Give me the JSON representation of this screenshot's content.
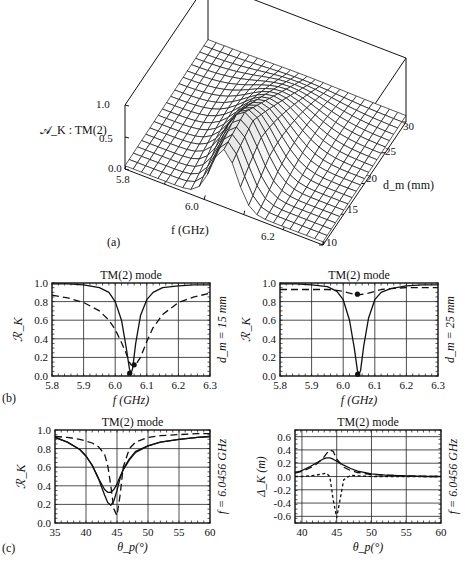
{
  "figure": {
    "header_fragment": "…",
    "panel_a": {
      "label": "(a)",
      "z_label": "𝒜_K : TM(2)",
      "z_ticks": [
        "0.0",
        "0.5",
        "1.0"
      ],
      "x_label": "f (GHz)",
      "x_ticks": [
        "5.8",
        "6.0",
        "6.2"
      ],
      "y_label": "d_m (mm)",
      "y_ticks": [
        "10",
        "15",
        "20",
        "25",
        "30"
      ]
    },
    "panel_b": {
      "label": "(b)",
      "left": {
        "title": "TM(2) mode",
        "ylabel": "ℛ_K",
        "xlabel": "f (GHz)",
        "side_label": "d_m = 15 mm"
      },
      "right": {
        "title": "TM(2) mode",
        "ylabel": "ℛ_K",
        "xlabel": "f (GHz)",
        "side_label": "d_m = 25 mm"
      }
    },
    "panel_c": {
      "label": "(c)",
      "left": {
        "title": "TM(2) mode",
        "ylabel": "ℛ_K",
        "xlabel": "θ_p(°)",
        "side_label": "f = 6.0456 GHz"
      },
      "right": {
        "title": "TM(2) mode",
        "ylabel": "Δ_K (m)",
        "xlabel": "θ_p(°)",
        "side_label": "f = 6.0456 GHz"
      }
    }
  },
  "chart_data": [
    {
      "id": "a",
      "type": "surface3d",
      "title": "",
      "xlabel": "f (GHz)",
      "ylabel": "d_m (mm)",
      "zlabel": "A_K : TM(2)",
      "xlim": [
        5.8,
        6.3
      ],
      "ylim": [
        10,
        30
      ],
      "zlim": [
        0,
        1
      ],
      "x_ticks": [
        5.8,
        6.0,
        6.2
      ],
      "y_ticks": [
        10,
        15,
        20,
        25,
        30
      ],
      "z_ticks": [
        0.0,
        0.5,
        1.0
      ],
      "description": "Absorption surface peaking near f≈6.05 GHz, d_m≈15 mm (~1.0), decaying to ~0.05 at the edges and for large d_m (~0.1 at 30 mm)",
      "peak": {
        "f": 6.05,
        "d_m": 15,
        "value": 1.0
      }
    },
    {
      "id": "b-left",
      "type": "line",
      "title": "TM(2) mode",
      "xlabel": "f (GHz)",
      "ylabel": "R_K",
      "xlim": [
        5.8,
        6.3
      ],
      "ylim": [
        0,
        1
      ],
      "x_ticks": [
        5.8,
        5.9,
        6.0,
        6.1,
        6.2,
        6.3
      ],
      "y_ticks": [
        0.0,
        0.2,
        0.4,
        0.6,
        0.8,
        1.0
      ],
      "grid": true,
      "annotation": "d_m = 15 mm",
      "x": [
        5.8,
        5.85,
        5.9,
        5.95,
        5.98,
        6.0,
        6.02,
        6.035,
        6.045,
        6.05,
        6.055,
        6.065,
        6.08,
        6.1,
        6.12,
        6.15,
        6.2,
        6.25,
        6.3
      ],
      "series": [
        {
          "name": "solid",
          "style": "solid",
          "values": [
            0.99,
            0.99,
            0.98,
            0.95,
            0.9,
            0.8,
            0.6,
            0.3,
            0.08,
            0.03,
            0.08,
            0.35,
            0.65,
            0.82,
            0.9,
            0.95,
            0.97,
            0.98,
            0.98
          ]
        },
        {
          "name": "dashed",
          "style": "dashed",
          "values": [
            0.87,
            0.84,
            0.79,
            0.7,
            0.6,
            0.5,
            0.36,
            0.24,
            0.15,
            0.12,
            0.11,
            0.12,
            0.2,
            0.37,
            0.52,
            0.66,
            0.79,
            0.85,
            0.89
          ]
        }
      ],
      "markers": [
        {
          "series": "solid",
          "x": 6.046,
          "y": 0.03
        },
        {
          "series": "dashed",
          "x": 6.06,
          "y": 0.12
        }
      ]
    },
    {
      "id": "b-right",
      "type": "line",
      "title": "TM(2) mode",
      "xlabel": "f (GHz)",
      "ylabel": "R_K",
      "xlim": [
        5.8,
        6.3
      ],
      "ylim": [
        0,
        1
      ],
      "x_ticks": [
        5.8,
        5.9,
        6.0,
        6.1,
        6.2,
        6.3
      ],
      "y_ticks": [
        0.0,
        0.2,
        0.4,
        0.6,
        0.8,
        1.0
      ],
      "grid": true,
      "annotation": "d_m = 25 mm",
      "x": [
        5.8,
        5.85,
        5.9,
        5.95,
        5.98,
        6.0,
        6.02,
        6.035,
        6.045,
        6.05,
        6.055,
        6.065,
        6.08,
        6.1,
        6.12,
        6.15,
        6.2,
        6.25,
        6.3
      ],
      "series": [
        {
          "name": "solid",
          "style": "solid",
          "values": [
            0.99,
            0.99,
            0.98,
            0.96,
            0.91,
            0.82,
            0.6,
            0.3,
            0.06,
            0.02,
            0.06,
            0.32,
            0.62,
            0.82,
            0.9,
            0.94,
            0.97,
            0.98,
            0.98
          ]
        },
        {
          "name": "dashed",
          "style": "dashed",
          "values": [
            0.93,
            0.93,
            0.93,
            0.93,
            0.92,
            0.91,
            0.89,
            0.88,
            0.875,
            0.875,
            0.876,
            0.88,
            0.89,
            0.91,
            0.93,
            0.94,
            0.95,
            0.95,
            0.95
          ]
        }
      ],
      "markers": [
        {
          "series": "solid",
          "x": 6.046,
          "y": 0.02
        },
        {
          "series": "dashed",
          "x": 6.045,
          "y": 0.88
        }
      ]
    },
    {
      "id": "c-left",
      "type": "line",
      "title": "TM(2) mode",
      "xlabel": "θ_p (°)",
      "ylabel": "R_K",
      "xlim": [
        35,
        60
      ],
      "ylim": [
        0,
        1
      ],
      "x_ticks": [
        35,
        40,
        45,
        50,
        55,
        60
      ],
      "y_ticks": [
        0.0,
        0.2,
        0.4,
        0.6,
        0.8,
        1.0
      ],
      "grid": true,
      "annotation": "f = 6.0456 GHz",
      "x": [
        35,
        37,
        39,
        40,
        41,
        42,
        43,
        43.5,
        44,
        44.5,
        45,
        45.5,
        46,
        47,
        48,
        50,
        52,
        55,
        58,
        60
      ],
      "series": [
        {
          "name": "solid",
          "style": "solid",
          "values": [
            0.92,
            0.87,
            0.79,
            0.72,
            0.62,
            0.48,
            0.36,
            0.33,
            0.33,
            0.36,
            0.42,
            0.5,
            0.57,
            0.68,
            0.76,
            0.83,
            0.87,
            0.9,
            0.92,
            0.93
          ]
        },
        {
          "name": "solid-2",
          "style": "solid",
          "values": [
            0.92,
            0.87,
            0.79,
            0.72,
            0.62,
            0.48,
            0.3,
            0.22,
            0.19,
            0.24,
            0.35,
            0.48,
            0.58,
            0.69,
            0.77,
            0.83,
            0.87,
            0.9,
            0.92,
            0.93
          ]
        },
        {
          "name": "dashed",
          "style": "dashed",
          "values": [
            0.93,
            0.92,
            0.9,
            0.88,
            0.86,
            0.82,
            0.74,
            0.62,
            0.4,
            0.15,
            0.08,
            0.3,
            0.6,
            0.8,
            0.87,
            0.92,
            0.94,
            0.95,
            0.96,
            0.96
          ]
        }
      ]
    },
    {
      "id": "c-right",
      "type": "line",
      "title": "TM(2) mode",
      "xlabel": "θ_p (°)",
      "ylabel": "Δ_K (m)",
      "xlim": [
        39,
        60
      ],
      "ylim": [
        -0.7,
        0.7
      ],
      "x_ticks": [
        40,
        45,
        50,
        55,
        60
      ],
      "y_ticks": [
        -0.6,
        -0.4,
        -0.2,
        0.0,
        0.2,
        0.4,
        0.6
      ],
      "grid": true,
      "annotation": "f = 6.0456 GHz",
      "x": [
        39,
        40,
        41,
        42,
        43,
        43.5,
        44,
        44.5,
        45,
        46,
        47,
        48,
        50,
        52,
        55,
        58,
        60
      ],
      "series": [
        {
          "name": "solid",
          "style": "solid",
          "values": [
            0.06,
            0.09,
            0.14,
            0.2,
            0.26,
            0.28,
            0.28,
            0.26,
            0.23,
            0.17,
            0.12,
            0.08,
            0.04,
            0.02,
            0.01,
            0.0,
            0.0
          ]
        },
        {
          "name": "long-dashed",
          "style": "dashed",
          "values": [
            0.05,
            0.08,
            0.12,
            0.18,
            0.27,
            0.34,
            0.4,
            0.38,
            0.26,
            0.14,
            0.09,
            0.06,
            0.03,
            0.02,
            0.01,
            0.0,
            0.0
          ]
        },
        {
          "name": "short-dashed",
          "style": "dotted",
          "values": [
            0.0,
            0.0,
            0.01,
            0.02,
            0.04,
            0.05,
            0.0,
            -0.35,
            -0.62,
            -0.05,
            0.02,
            0.01,
            0.0,
            0.0,
            0.0,
            0.0,
            0.0
          ]
        }
      ]
    }
  ]
}
